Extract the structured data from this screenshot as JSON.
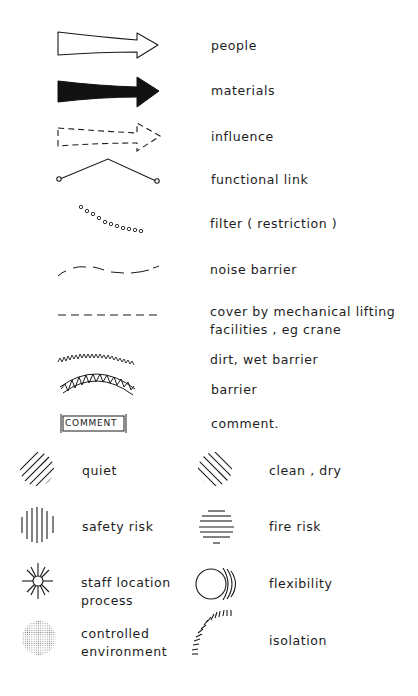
{
  "legend": {
    "rows": [
      {
        "id": "people",
        "label": "people",
        "icon": "hollow-arrow-icon"
      },
      {
        "id": "materials",
        "label": "materials",
        "icon": "solid-arrow-icon"
      },
      {
        "id": "influence",
        "label": "influence",
        "icon": "dashed-arrow-icon"
      },
      {
        "id": "functional-link",
        "label": "functional link",
        "icon": "angled-link-icon"
      },
      {
        "id": "filter",
        "label": "filter ( restriction )",
        "icon": "dotted-curve-icon"
      },
      {
        "id": "noise-barrier",
        "label": "noise barrier",
        "icon": "wavy-dashed-line-icon"
      },
      {
        "id": "cover",
        "label_line1": "cover by mechanical lifting",
        "label_line2": "facilities , eg crane",
        "icon": "dashed-line-icon"
      },
      {
        "id": "dirt-wet-barrier",
        "label": "dirt, wet barrier",
        "icon": "zigzag-line-icon"
      },
      {
        "id": "barrier",
        "label": "barrier",
        "icon": "truss-arc-icon"
      },
      {
        "id": "comment",
        "label": "comment.",
        "box_text": "COMMENT",
        "icon": "comment-box-icon"
      }
    ],
    "grid": [
      {
        "id": "quiet",
        "label": "quiet",
        "icon": "diagonal-hatch-circle-icon"
      },
      {
        "id": "clean-dry",
        "label": "clean , dry",
        "icon": "reverse-diagonal-hatch-circle-icon"
      },
      {
        "id": "safety-risk",
        "label": "safety risk",
        "icon": "vertical-hatch-circle-icon"
      },
      {
        "id": "fire-risk",
        "label": "fire risk",
        "icon": "horizontal-hatch-circle-icon"
      },
      {
        "id": "staff-location",
        "label_line1": "staff location",
        "label_line2": "process",
        "icon": "starburst-icon"
      },
      {
        "id": "flexibility",
        "label": "flexibility",
        "icon": "circle-ripples-icon"
      },
      {
        "id": "controlled-environment",
        "label_line1": "controlled",
        "label_line2": "environment",
        "icon": "stippled-circle-icon"
      },
      {
        "id": "isolation",
        "label": "isolation",
        "icon": "tick-arc-icon"
      }
    ]
  },
  "colors": {
    "ink": "#1a1a1a",
    "background": "#ffffff",
    "stipple": "#8a8a8a"
  }
}
